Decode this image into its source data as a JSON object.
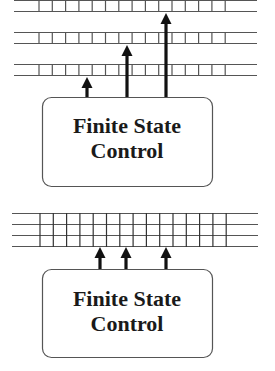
{
  "diagrams": [
    {
      "name": "multi-tape-turing-machine",
      "control_label_line1": "Finite State",
      "control_label_line2": "Control",
      "tapes": 3,
      "heads": 3
    },
    {
      "name": "multi-track-turing-machine",
      "control_label_line1": "Finite State",
      "control_label_line2": "Control",
      "tracks": 3,
      "heads": 3
    }
  ],
  "colors": {
    "line": "#555555",
    "arrow": "#111111",
    "box_stroke": "#555555",
    "text": "#1a1a1a"
  }
}
